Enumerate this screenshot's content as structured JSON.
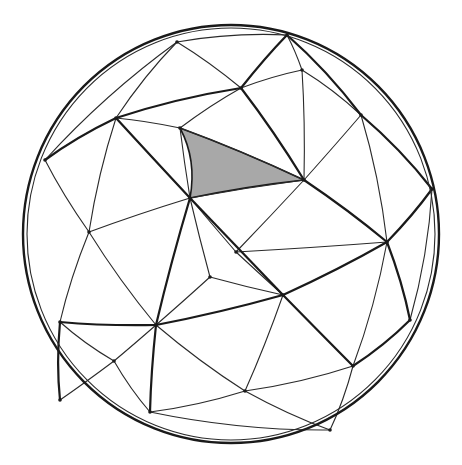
{
  "figure": {
    "colors": {
      "line": "#1a1a1a",
      "shade": "#a8a8a8",
      "background": "#ffffff"
    },
    "sphere": {
      "cx": 231,
      "cy": 234,
      "rx": 208,
      "ry": 209
    },
    "shaded_face": [
      [
        180,
        128
      ],
      [
        190,
        198
      ],
      [
        304,
        180
      ]
    ],
    "vertices": [
      [
        177,
        42
      ],
      [
        287,
        35
      ],
      [
        241,
        88
      ],
      [
        116,
        118
      ],
      [
        180,
        128
      ],
      [
        190,
        198
      ],
      [
        304,
        180
      ],
      [
        361,
        115
      ],
      [
        302,
        70
      ],
      [
        89,
        232
      ],
      [
        387,
        242
      ],
      [
        432,
        189
      ],
      [
        283,
        295
      ],
      [
        156,
        325
      ],
      [
        245,
        391
      ],
      [
        353,
        366
      ],
      [
        150,
        412
      ],
      [
        60,
        322
      ],
      [
        114,
        361
      ],
      [
        45,
        160
      ],
      [
        236,
        252
      ],
      [
        210,
        277
      ],
      [
        410,
        320
      ],
      [
        330,
        430
      ],
      [
        60,
        400
      ]
    ],
    "thick_edges": [
      [
        3,
        5
      ],
      [
        5,
        12
      ],
      [
        12,
        15
      ],
      [
        15,
        22
      ],
      [
        17,
        13
      ],
      [
        13,
        12
      ],
      [
        12,
        10
      ],
      [
        10,
        11
      ],
      [
        19,
        3
      ],
      [
        3,
        2
      ],
      [
        2,
        1
      ],
      [
        2,
        6
      ],
      [
        6,
        10
      ],
      [
        10,
        22
      ],
      [
        13,
        16
      ],
      [
        5,
        13
      ],
      [
        17,
        24
      ],
      [
        1,
        7
      ],
      [
        7,
        11
      ]
    ],
    "thin_edges": [
      [
        0,
        1
      ],
      [
        0,
        2
      ],
      [
        0,
        3
      ],
      [
        1,
        8
      ],
      [
        2,
        8
      ],
      [
        8,
        7
      ],
      [
        8,
        6
      ],
      [
        2,
        4
      ],
      [
        3,
        4
      ],
      [
        4,
        5
      ],
      [
        4,
        6
      ],
      [
        5,
        6
      ],
      [
        6,
        7
      ],
      [
        7,
        10
      ],
      [
        6,
        20
      ],
      [
        5,
        20
      ],
      [
        20,
        12
      ],
      [
        20,
        10
      ],
      [
        5,
        9
      ],
      [
        3,
        9
      ],
      [
        9,
        19
      ],
      [
        9,
        17
      ],
      [
        9,
        13
      ],
      [
        5,
        21
      ],
      [
        21,
        13
      ],
      [
        21,
        12
      ],
      [
        13,
        18
      ],
      [
        17,
        18
      ],
      [
        18,
        16
      ],
      [
        16,
        14
      ],
      [
        13,
        14
      ],
      [
        14,
        12
      ],
      [
        14,
        15
      ],
      [
        15,
        10
      ],
      [
        15,
        23
      ],
      [
        14,
        23
      ],
      [
        16,
        23
      ],
      [
        24,
        18
      ],
      [
        22,
        11
      ],
      [
        0,
        19
      ]
    ]
  }
}
